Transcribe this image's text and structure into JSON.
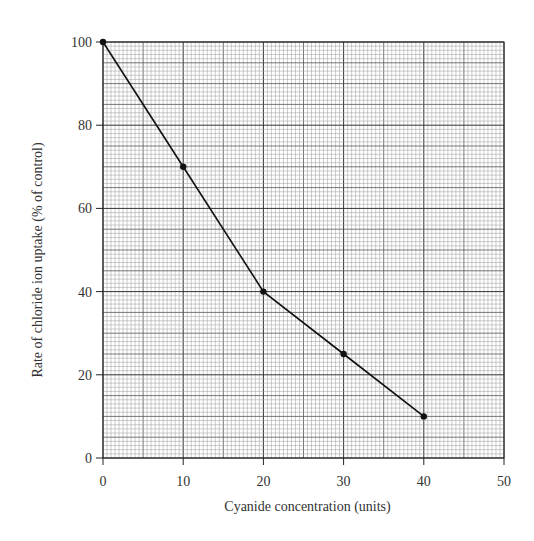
{
  "chart_data": {
    "type": "line",
    "title": "",
    "xlabel": "Cyanide concentration (units)",
    "ylabel": "Rate of chloride ion uptake (% of control)",
    "xlim": [
      0,
      50
    ],
    "ylim": [
      0,
      100
    ],
    "x_ticks": [
      0,
      10,
      20,
      30,
      40,
      50
    ],
    "y_ticks": [
      0,
      20,
      40,
      60,
      80,
      100
    ],
    "x_tick_labels": [
      "0",
      "10",
      "20",
      "30",
      "40",
      "50"
    ],
    "y_tick_labels": [
      "0",
      "20",
      "40",
      "60",
      "80",
      "100"
    ],
    "grid": true,
    "grid_style": "graph paper: minor every 0.5 x-units / 1 y-unit; major every 5 x-units / 10 y-units",
    "legend": null,
    "series": [
      {
        "name": "Chloride ion uptake",
        "x": [
          0,
          10,
          20,
          30,
          40
        ],
        "y": [
          100,
          70,
          40,
          25,
          10
        ],
        "marker": "circle",
        "color": "#111111"
      }
    ]
  },
  "layout": {
    "plot_left": 103,
    "plot_top": 42,
    "plot_right": 504,
    "plot_bottom": 458
  }
}
